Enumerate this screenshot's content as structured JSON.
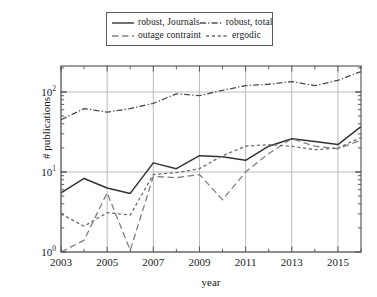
{
  "chart_data": {
    "type": "line",
    "title": "",
    "xlabel": "year",
    "ylabel": "# publications",
    "yscale": "log",
    "xlim": [
      2003,
      2016
    ],
    "ylim": [
      1,
      200
    ],
    "grid": true,
    "legend_position": "above-plot",
    "x": [
      2003,
      2004,
      2005,
      2006,
      2007,
      2008,
      2009,
      2010,
      2011,
      2012,
      2013,
      2014,
      2015,
      2016
    ],
    "xticks": [
      "2003",
      "2005",
      "2007",
      "2009",
      "2011",
      "2013",
      "2015"
    ],
    "xtick_values": [
      2003,
      2005,
      2007,
      2009,
      2011,
      2013,
      2015
    ],
    "yticks": [
      "10^0",
      "10^1",
      "10^2"
    ],
    "ytick_values": [
      1,
      10,
      100
    ],
    "series": [
      {
        "name": "robust, Journals",
        "style": "solid",
        "color": "#333333",
        "values": [
          5.5,
          8.3,
          6.3,
          5.4,
          13.0,
          11.0,
          16.0,
          15.5,
          14.0,
          21.0,
          26.0,
          24.0,
          22.0,
          37.0
        ]
      },
      {
        "name": "robust, total",
        "style": "dash-dot",
        "color": "#4d4d4d",
        "values": [
          45.0,
          62.0,
          56.0,
          62.0,
          72.0,
          95.0,
          90.0,
          105.0,
          120.0,
          125.0,
          135.0,
          120.0,
          140.0,
          180.0
        ]
      },
      {
        "name": "outage contraint",
        "style": "long-dash",
        "color": "#808080",
        "values": [
          1.0,
          1.4,
          5.5,
          1.05,
          8.8,
          8.5,
          9.3,
          4.5,
          10.0,
          17.0,
          26.0,
          21.0,
          19.5,
          25.0
        ]
      },
      {
        "name": "ergodic",
        "style": "short-dash",
        "color": "#6e6e6e",
        "values": [
          3.0,
          2.1,
          3.1,
          2.9,
          9.3,
          9.8,
          11.0,
          16.0,
          21.0,
          22.0,
          21.0,
          19.0,
          20.0,
          27.0
        ]
      }
    ]
  },
  "legend": {
    "entries": [
      {
        "label": "robust, Journals",
        "style": "solid"
      },
      {
        "label": "robust, total",
        "style": "dash-dot"
      },
      {
        "label": "outage contraint",
        "style": "long-dash"
      },
      {
        "label": "ergodic",
        "style": "short-dash"
      }
    ]
  },
  "axes": {
    "y_axis_title": "# publications",
    "x_axis_title": "year",
    "y_tick_labels": [
      {
        "mantissa": "10",
        "exp": "0"
      },
      {
        "mantissa": "10",
        "exp": "1"
      },
      {
        "mantissa": "10",
        "exp": "2"
      }
    ],
    "x_tick_labels": [
      "2003",
      "2005",
      "2007",
      "2009",
      "2011",
      "2013",
      "2015"
    ]
  },
  "colors": {
    "axis": "#4d4d4d",
    "grid": "#b3b3b3",
    "text": "#1a1a1a",
    "background": "#ffffff"
  }
}
